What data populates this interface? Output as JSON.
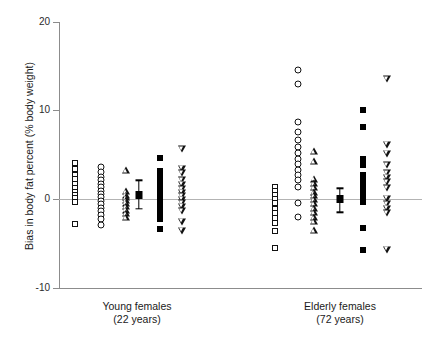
{
  "chart_data": {
    "type": "scatter",
    "title": "",
    "xlabel": "",
    "ylabel": "Bias in body fat percent (% body weight)",
    "ylim": [
      -10,
      20
    ],
    "yticks": [
      20,
      10,
      0,
      -10
    ],
    "ytick_labels": [
      "20",
      "10",
      "0",
      "-10"
    ],
    "grid": false,
    "legend": "none",
    "reference_line": 0,
    "groups": [
      {
        "name": "Young females",
        "sublabel": "(22 years)",
        "center_x": 137,
        "series": [
          {
            "name": "open-square",
            "marker": "square-open",
            "x": 75,
            "values": [
              4.1,
              3.4,
              2.7,
              2.2,
              1.7,
              1.2,
              0.8,
              0.4,
              0.1,
              -0.3,
              -2.8
            ]
          },
          {
            "name": "open-circle",
            "marker": "circle-open",
            "x": 101,
            "values": [
              3.6,
              3.0,
              2.5,
              2.1,
              1.7,
              1.3,
              0.9,
              0.6,
              0.2,
              -0.2,
              -0.6,
              -1.0,
              -1.4,
              -1.8,
              -2.3,
              -2.9
            ]
          },
          {
            "name": "open-triangle-up",
            "marker": "triangle-up-open",
            "x": 126,
            "values": [
              3.3,
              0.9,
              0.5,
              0.2,
              -0.1,
              -0.4,
              -0.8,
              -1.2,
              -1.6,
              -2.0
            ]
          },
          {
            "name": "mean-se",
            "marker": "mean-error-bar",
            "x": 139,
            "mean": 0.5,
            "se_low": -1.1,
            "se_high": 2.1
          },
          {
            "name": "filled-square",
            "marker": "square-filled",
            "x": 160,
            "values": [
              4.6,
              3.2,
              2.6,
              2.0,
              1.4,
              0.8,
              0.3,
              -0.2,
              -0.7,
              -1.2,
              -1.7,
              -2.3,
              -3.4
            ]
          },
          {
            "name": "open-triangle-down",
            "marker": "triangle-down-open",
            "x": 182,
            "values": [
              5.6,
              3.4,
              2.9,
              2.1,
              1.6,
              1.1,
              0.7,
              0.3,
              -0.1,
              -0.5,
              -0.9,
              -1.4,
              -2.6,
              -3.6
            ]
          }
        ]
      },
      {
        "name": "Elderly females",
        "sublabel": "(72 years)",
        "center_x": 340,
        "series": [
          {
            "name": "open-square",
            "marker": "square-open",
            "x": 275,
            "values": [
              1.4,
              0.9,
              0.4,
              0.0,
              -0.5,
              -1.1,
              -1.6,
              -2.1,
              -2.7,
              -3.6,
              -5.5
            ]
          },
          {
            "name": "open-circle",
            "marker": "circle-open",
            "x": 298,
            "values": [
              14.5,
              13.0,
              8.7,
              7.6,
              6.7,
              5.9,
              5.2,
              4.5,
              3.9,
              3.3,
              2.7,
              2.1,
              1.3,
              -0.4,
              -2.0
            ]
          },
          {
            "name": "open-triangle-up",
            "marker": "triangle-up-open",
            "x": 314,
            "values": [
              5.4,
              4.3,
              2.3,
              1.8,
              1.3,
              0.8,
              0.4,
              0.0,
              -0.5,
              -1.0,
              -1.5,
              -2.0,
              -2.5,
              -3.5
            ]
          },
          {
            "name": "mean-se",
            "marker": "mean-error-bar",
            "x": 340,
            "mean": 0.0,
            "se_low": -1.5,
            "se_high": 1.2
          },
          {
            "name": "filled-square",
            "marker": "square-filled",
            "x": 363,
            "values": [
              10.0,
              8.1,
              4.5,
              3.8,
              2.7,
              2.2,
              1.7,
              1.2,
              0.7,
              0.2,
              -0.3,
              -3.3,
              -5.7
            ]
          },
          {
            "name": "open-triangle-down",
            "marker": "triangle-down-open",
            "x": 387,
            "values": [
              13.5,
              6.1,
              5.1,
              3.8,
              2.9,
              2.4,
              1.9,
              1.2,
              0.0,
              -0.6,
              -1.1,
              -1.6,
              -5.7
            ]
          }
        ]
      }
    ]
  }
}
